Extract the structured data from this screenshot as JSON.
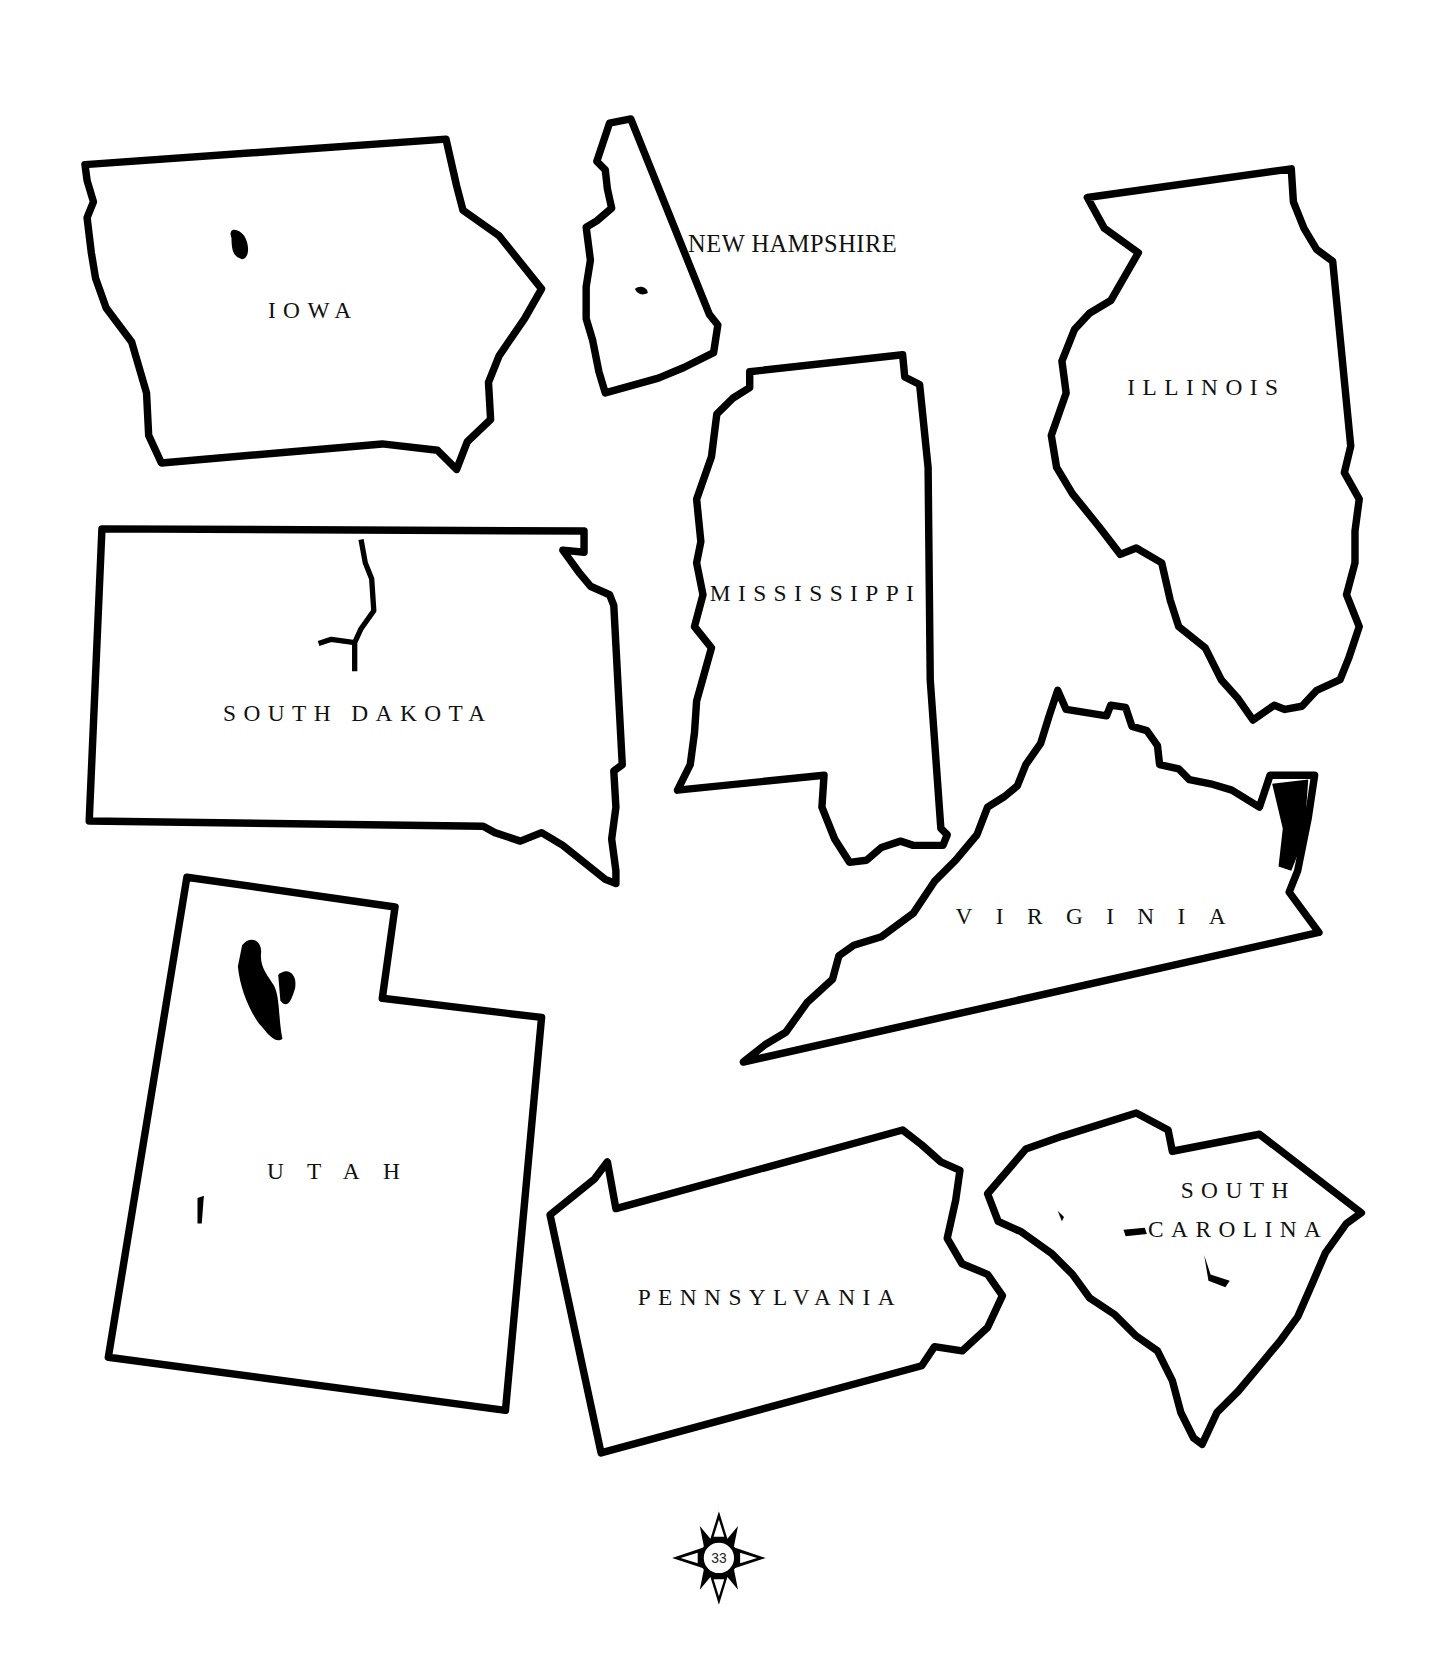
{
  "page": {
    "page_number": "33",
    "background": "#ffffff",
    "outline_color": "#000000"
  },
  "states": {
    "iowa": {
      "label": "IOWA"
    },
    "new_hampshire": {
      "label": "NEW HAMPSHIRE"
    },
    "illinois": {
      "label": "ILLINOIS"
    },
    "mississippi": {
      "label": "MISSISSIPPI"
    },
    "south_dakota": {
      "label": "SOUTH DAKOTA"
    },
    "virginia": {
      "label": "VIRGINIA"
    },
    "utah": {
      "label": "UTAH"
    },
    "pennsylvania": {
      "label": "PENNSYLVANIA"
    },
    "south_carolina": {
      "label_line1": "SOUTH",
      "label_line2": "CAROLINA"
    }
  },
  "compass": {
    "icon": "compass-rose-icon",
    "number": "33"
  }
}
